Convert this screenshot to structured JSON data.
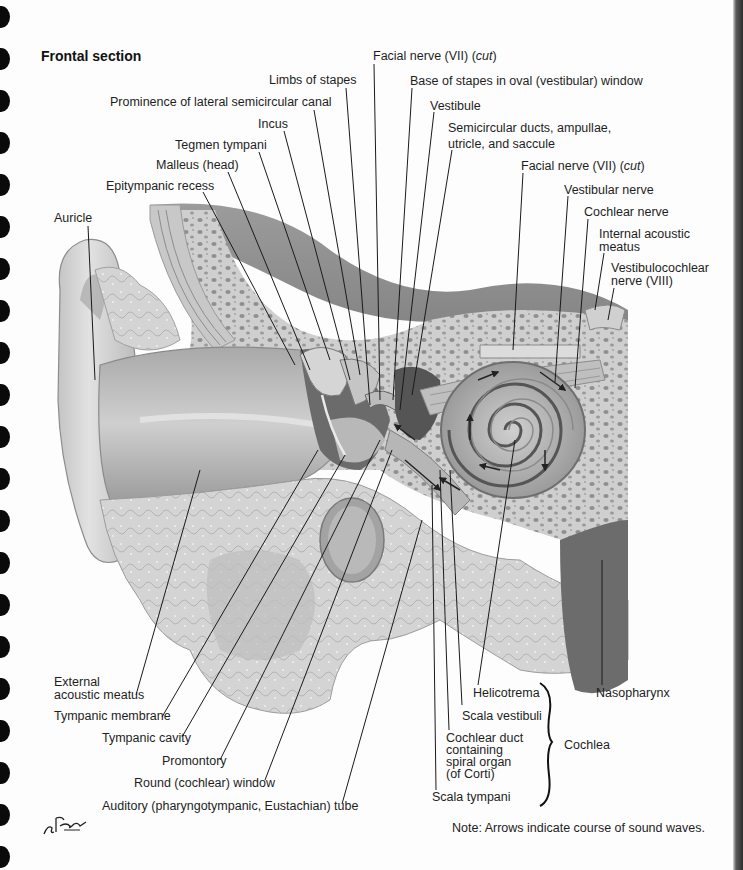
{
  "figure": {
    "title": "Frontal section",
    "note": "Note: Arrows indicate course of sound waves.",
    "signature": "F. Netter M.D."
  },
  "colors": {
    "paper": "#fdfdfd",
    "ink": "#1e1e1e",
    "bone_light": "#d9d9d9",
    "bone_pore": "#8c8c8c",
    "soft_tissue": "#bdbdbd",
    "dark_tissue": "#6e6e6e",
    "binding_hole": "#0a0a0a"
  },
  "labels": {
    "top": [
      {
        "id": "facial-nerve-cut-1",
        "text": "Facial nerve (VII) ",
        "italic": "cut"
      },
      {
        "id": "limbs-of-stapes",
        "text": "Limbs of stapes"
      },
      {
        "id": "base-of-stapes",
        "text": "Base of stapes in oval (vestibular) window"
      },
      {
        "id": "prominence-lateral-semicircular-canal",
        "text": "Prominence of lateral semicircular canal"
      },
      {
        "id": "vestibule",
        "text": "Vestibule"
      },
      {
        "id": "incus",
        "text": "Incus"
      },
      {
        "id": "semicircular-ducts",
        "text": "Semicircular ducts, ampullae,\nutricle, and saccule"
      },
      {
        "id": "tegmen-tympani",
        "text": "Tegmen tympani"
      },
      {
        "id": "malleus-head",
        "text": "Malleus (head)"
      },
      {
        "id": "facial-nerve-cut-2",
        "text": "Facial nerve (VII) ",
        "italic": "cut"
      },
      {
        "id": "epitympanic-recess",
        "text": "Epitympanic recess"
      },
      {
        "id": "vestibular-nerve",
        "text": "Vestibular nerve"
      },
      {
        "id": "auricle",
        "text": "Auricle"
      },
      {
        "id": "cochlear-nerve",
        "text": "Cochlear nerve"
      },
      {
        "id": "internal-acoustic-meatus",
        "text": "Internal acoustic\nmeatus"
      },
      {
        "id": "vestibulocochlear-nerve",
        "text": "Vestibulocochlear\nnerve (VIII)"
      }
    ],
    "bottom": [
      {
        "id": "external-acoustic-meatus",
        "text": "External\nacoustic meatus"
      },
      {
        "id": "tympanic-membrane",
        "text": "Tympanic membrane"
      },
      {
        "id": "tympanic-cavity",
        "text": "Tympanic cavity"
      },
      {
        "id": "promontory",
        "text": "Promontory"
      },
      {
        "id": "round-window",
        "text": "Round (cochlear) window"
      },
      {
        "id": "auditory-tube",
        "text": "Auditory (pharyngotympanic, Eustachian) tube"
      },
      {
        "id": "helicotrema",
        "text": "Helicotrema"
      },
      {
        "id": "scala-vestibuli",
        "text": "Scala vestibuli"
      },
      {
        "id": "cochlear-duct",
        "text": "Cochlear duct\ncontaining\nspiral organ\n(of Corti)"
      },
      {
        "id": "scala-tympani",
        "text": "Scala tympani"
      },
      {
        "id": "cochlea",
        "text": "Cochlea"
      },
      {
        "id": "nasopharynx",
        "text": "Nasopharynx"
      }
    ]
  }
}
